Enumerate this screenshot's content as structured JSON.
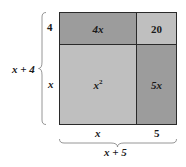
{
  "diagram": {
    "colors": {
      "dark_cell": "#9c9c9c",
      "light_cell": "#bfbfbf",
      "border": "#2a2a2a"
    },
    "cells": {
      "top_left": "4x",
      "top_right": "20",
      "bottom_left": "x",
      "bottom_left_exp": "2",
      "bottom_right": "5x"
    },
    "left_labels": {
      "top": "4",
      "bottom": "x",
      "total": "x + 4"
    },
    "bottom_labels": {
      "left": "x",
      "right": "5",
      "total": "x + 5"
    }
  }
}
